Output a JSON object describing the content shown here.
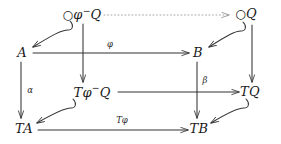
{
  "diagram": {
    "type": "commutative-diagram",
    "stroke_color": "#333333",
    "dotted_color": "#999999",
    "background": "#ffffff",
    "nodes": [
      {
        "id": "circ-phi-minus-q",
        "text": "○φ⁻Q",
        "x": 82,
        "y": 14,
        "row": "top"
      },
      {
        "id": "circ-q",
        "text": "○Q",
        "x": 246,
        "y": 14,
        "row": "top"
      },
      {
        "id": "a",
        "text": "A",
        "x": 22,
        "y": 52,
        "row": "upper"
      },
      {
        "id": "b",
        "text": "B",
        "x": 198,
        "y": 52,
        "row": "upper"
      },
      {
        "id": "t-phi-minus-q",
        "text": "Tφ⁻Q",
        "x": 92,
        "y": 91,
        "row": "lower"
      },
      {
        "id": "tq",
        "text": "TQ",
        "x": 250,
        "y": 91,
        "row": "lower"
      },
      {
        "id": "ta",
        "text": "TA",
        "x": 24,
        "y": 128,
        "row": "bottom"
      },
      {
        "id": "tb",
        "text": "TB",
        "x": 199,
        "y": 128,
        "row": "bottom"
      }
    ],
    "arrow_labels": [
      {
        "id": "phi",
        "text": "φ",
        "x": 110,
        "y": 44
      },
      {
        "id": "alpha",
        "text": "α",
        "x": 30,
        "y": 90
      },
      {
        "id": "beta",
        "text": "β",
        "x": 205,
        "y": 80
      },
      {
        "id": "t-phi",
        "text": "Tφ",
        "x": 122,
        "y": 120
      }
    ],
    "edges": [
      {
        "id": "dotted-top",
        "from": "circ-phi-minus-q",
        "to": "circ-q",
        "style": "dotted"
      },
      {
        "id": "hook-to-a",
        "from": "circ-phi-minus-q",
        "to": "a",
        "style": "curved-hook"
      },
      {
        "id": "hook-to-b",
        "from": "circ-q",
        "to": "b",
        "style": "curved-hook"
      },
      {
        "id": "a-to-b",
        "from": "a",
        "to": "b",
        "style": "solid",
        "label": "phi"
      },
      {
        "id": "vert-mid-left",
        "from": "circ-phi-minus-q",
        "to": "t-phi-minus-q",
        "style": "solid"
      },
      {
        "id": "vert-mid-right",
        "from": "circ-q",
        "to": "tq",
        "style": "solid"
      },
      {
        "id": "a-to-ta",
        "from": "a",
        "to": "ta",
        "style": "solid",
        "label": "alpha"
      },
      {
        "id": "b-to-tb",
        "from": "b",
        "to": "tb",
        "style": "solid",
        "label": "beta"
      },
      {
        "id": "tphiq-to-tq",
        "from": "t-phi-minus-q",
        "to": "tq",
        "style": "solid"
      },
      {
        "id": "hook-to-ta",
        "from": "t-phi-minus-q",
        "to": "ta",
        "style": "curved-hook"
      },
      {
        "id": "hook-to-tb",
        "from": "tq",
        "to": "tb",
        "style": "curved-hook"
      },
      {
        "id": "ta-to-tb",
        "from": "ta",
        "to": "tb",
        "style": "solid",
        "label": "t-phi"
      }
    ]
  }
}
